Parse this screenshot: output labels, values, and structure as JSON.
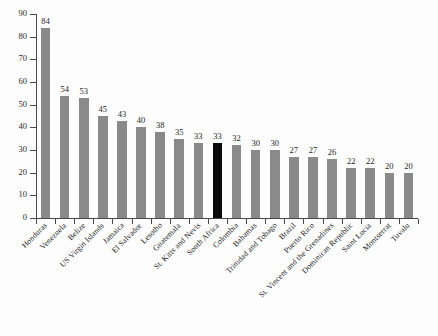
{
  "chart_data": {
    "type": "bar",
    "title": "",
    "subtitle": "",
    "xlabel": "",
    "ylabel": "",
    "ylim": [
      0,
      90
    ],
    "ytick_labels": [
      "0",
      "10",
      "20",
      "30",
      "40",
      "50",
      "60",
      "70",
      "80",
      "90"
    ],
    "ytick_values": [
      0,
      10,
      20,
      30,
      40,
      50,
      60,
      70,
      80,
      90
    ],
    "grid": false,
    "legend": false,
    "legend_position": "none",
    "bar_color": "#8a8a8a",
    "highlight_color": "#0a0a0a",
    "highlight_category": "South Africa",
    "categories": [
      "Honduras",
      "Venezuela",
      "Belize",
      "US Virgin Islands",
      "Jamaica",
      "El Salvador",
      "Lesotho",
      "Guatemala",
      "St. Kitts and Nevis",
      "South Africa",
      "Colombia",
      "Bahamas",
      "Trinidad and Tobago",
      "Brazil",
      "Puerto Rico",
      "St. Vincent and the Grenadines",
      "Dominican Republic",
      "Saint Lucia",
      "Montserrat",
      "Tuvalu"
    ],
    "values": [
      84,
      54,
      53,
      45,
      43,
      40,
      38,
      35,
      33,
      33,
      32,
      30,
      30,
      27,
      27,
      26,
      22,
      22,
      20,
      20
    ],
    "value_labels": [
      "84",
      "54",
      "53",
      "45",
      "43",
      "40",
      "38",
      "35",
      "33",
      "33",
      "32",
      "30",
      "30",
      "27",
      "27",
      "26",
      "22",
      "22",
      "20",
      "20"
    ],
    "highlighted": [
      false,
      false,
      false,
      false,
      false,
      false,
      false,
      false,
      false,
      true,
      false,
      false,
      false,
      false,
      false,
      false,
      false,
      false,
      false,
      false
    ]
  }
}
